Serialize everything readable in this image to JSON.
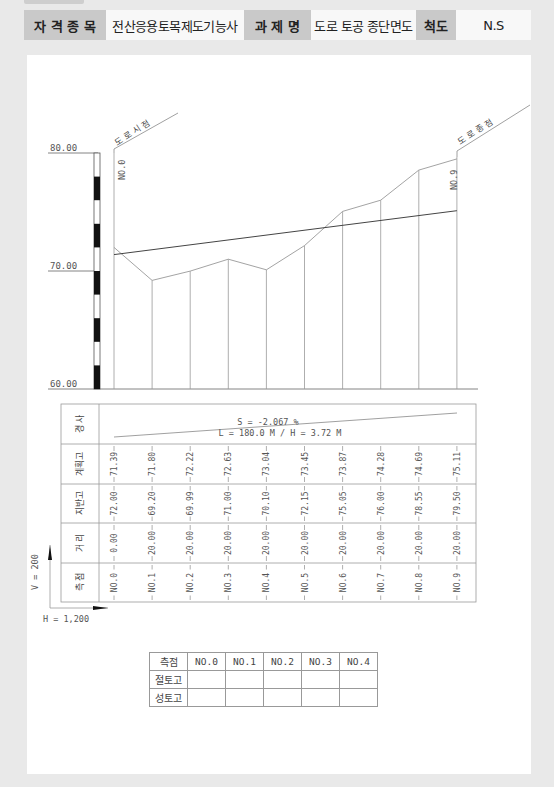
{
  "header": {
    "qualification_label": "자 격 종 목",
    "qualification_value": "전산응용토목제도기능사",
    "task_label": "과 제 명",
    "task_value": "도로 토공 종단면도",
    "scale_label": "척도",
    "scale_value": "N.S"
  },
  "profile": {
    "start_label": "도 로 시 점",
    "end_label": "도 로 종 점",
    "elev_labels": [
      "80.00",
      "70.00",
      "60.00"
    ],
    "first_station_label": "NO.0",
    "last_station_label": "NO.9",
    "slope_text": "S = -2.067 %",
    "length_text": "L = 180.0 M / H = 3.72 M",
    "vscale": "V = 200",
    "hscale": "H = 1,200"
  },
  "table": {
    "row_labels": [
      "경 사",
      "계획고",
      "지반고",
      "거 리",
      "측 점"
    ],
    "stations": [
      "NO.0",
      "NO.1",
      "NO.2",
      "NO.3",
      "NO.4",
      "NO.5",
      "NO.6",
      "NO.7",
      "NO.8",
      "NO.9"
    ],
    "planned": [
      "71.39",
      "71.80",
      "72.22",
      "72.63",
      "73.04",
      "73.45",
      "73.87",
      "74.28",
      "74.69",
      "75.11"
    ],
    "ground": [
      "72.00",
      "69.20",
      "69.99",
      "71.00",
      "70.10",
      "72.15",
      "75.05",
      "76.00",
      "78.55",
      "79.50"
    ],
    "distance": [
      "0.00",
      "20.00",
      "20.00",
      "20.00",
      "20.00",
      "20.00",
      "20.00",
      "20.00",
      "20.00",
      "20.00"
    ]
  },
  "summary": {
    "header": [
      "측점",
      "NO.0",
      "NO.1",
      "NO.2",
      "NO.3",
      "NO.4"
    ],
    "rows": [
      {
        "label": "절토고",
        "values": [
          "",
          "",
          "",
          "",
          ""
        ]
      },
      {
        "label": "성토고",
        "values": [
          "",
          "",
          "",
          "",
          ""
        ]
      }
    ]
  },
  "chart_data": {
    "type": "line",
    "title": "도로 토공 종단면도",
    "xlabel": "측점",
    "ylabel": "표고 (m)",
    "categories": [
      "NO.0",
      "NO.1",
      "NO.2",
      "NO.3",
      "NO.4",
      "NO.5",
      "NO.6",
      "NO.7",
      "NO.8",
      "NO.9"
    ],
    "series": [
      {
        "name": "지반고",
        "values": [
          72.0,
          69.2,
          69.99,
          71.0,
          70.1,
          72.15,
          75.05,
          76.0,
          78.55,
          79.5
        ]
      },
      {
        "name": "계획고",
        "values": [
          71.39,
          71.8,
          72.22,
          72.63,
          73.04,
          73.45,
          73.87,
          74.28,
          74.69,
          75.11
        ]
      }
    ],
    "ylim": [
      60,
      80
    ],
    "yticks": [
      "60.00",
      "70.00",
      "80.00"
    ],
    "annotations": [
      "S = -2.067 %",
      "L = 180.0 M / H = 3.72 M",
      "V = 200",
      "H = 1,200",
      "도로시점",
      "도로종점"
    ],
    "grid": false
  }
}
